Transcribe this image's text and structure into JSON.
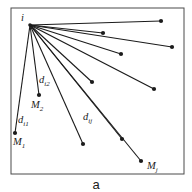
{
  "diagram": {
    "caption": "a",
    "frame": {
      "x": 11,
      "y": 8,
      "width": 173,
      "height": 166
    },
    "origin": {
      "label": "i",
      "x": 30,
      "y": 25,
      "label_x": 21,
      "label_y": 21
    },
    "points": [
      {
        "x": 161,
        "y": 21
      },
      {
        "x": 103,
        "y": 33
      },
      {
        "x": 172,
        "y": 47
      },
      {
        "x": 121,
        "y": 54
      },
      {
        "x": 92,
        "y": 82
      },
      {
        "x": 154,
        "y": 89
      },
      {
        "x": 122,
        "y": 139
      },
      {
        "x": 83,
        "y": 144
      },
      {
        "x": 141,
        "y": 161,
        "label": "M",
        "sub": "j",
        "label_x": 147,
        "label_y": 169
      },
      {
        "x": 39,
        "y": 95,
        "label": "M",
        "sub": "2",
        "label_x": 31,
        "label_y": 108
      },
      {
        "x": 15,
        "y": 133,
        "label": "M",
        "sub": "1",
        "label_x": 13,
        "label_y": 145
      }
    ],
    "distance_labels": [
      {
        "text": "d",
        "sub": "i1",
        "x": 18,
        "y": 123
      },
      {
        "text": "d",
        "sub": "i2",
        "x": 39,
        "y": 83
      },
      {
        "text": "d",
        "sub": "ij",
        "x": 83,
        "y": 120
      }
    ],
    "colors": {
      "ink": "#1b1b1b",
      "frame": "#4a4a4a",
      "background": "#ffffff"
    }
  }
}
